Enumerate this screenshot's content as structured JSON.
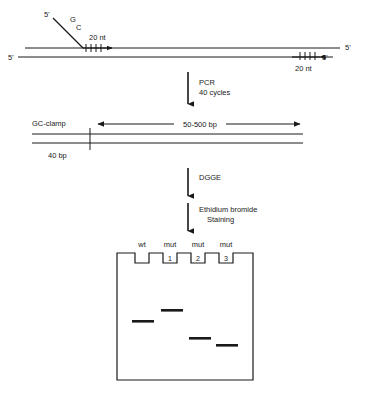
{
  "figure": {
    "ink_color": "#1a1a1a",
    "background_color": "#ffffff"
  },
  "template_stage": {
    "top_strand_label_right": "5'",
    "bottom_strand_label_left": "5'",
    "forward_primer": {
      "five_prime_label": "5'",
      "clamp_base_g": "G",
      "clamp_base_c": "C",
      "length_label": "20 nt"
    },
    "reverse_primer": {
      "five_prime_label": "5'",
      "length_label": "20 nt"
    }
  },
  "steps": {
    "pcr": {
      "line1": "PCR",
      "line2": "40 cycles"
    },
    "dgge": {
      "line1": "DGGE"
    },
    "staining": {
      "line1": "Ethidium bromide",
      "line2": "Staining"
    }
  },
  "product_stage": {
    "clamp_label": "GC-clamp",
    "clamp_size": "40 bp",
    "product_size": "50-500 bp"
  },
  "gel": {
    "lanes": [
      {
        "label": "wt",
        "number": "",
        "band_y": 322
      },
      {
        "label": "mut",
        "number": "1",
        "band_y": 311
      },
      {
        "label": "mut",
        "number": "2",
        "band_y": 339
      },
      {
        "label": "mut",
        "number": "3",
        "band_y": 345
      }
    ],
    "lane_labels": [
      "wt",
      "mut",
      "mut",
      "mut"
    ],
    "lane_numbers": [
      "",
      "1",
      "2",
      "3"
    ]
  }
}
